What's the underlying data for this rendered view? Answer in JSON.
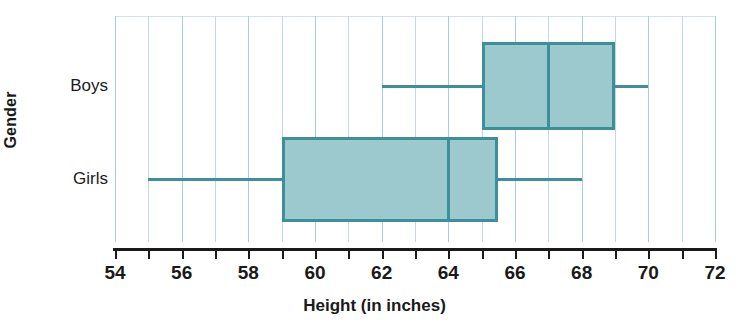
{
  "chart_data": {
    "type": "box",
    "title": "",
    "xlabel": "Height (in inches)",
    "ylabel": "Gender",
    "xlim": [
      54,
      72
    ],
    "xticks": [
      54,
      55,
      56,
      57,
      58,
      59,
      60,
      61,
      62,
      63,
      64,
      65,
      66,
      67,
      68,
      69,
      70,
      71,
      72
    ],
    "xtick_labels": [
      "54",
      "",
      "56",
      "",
      "58",
      "",
      "60",
      "",
      "62",
      "",
      "64",
      "",
      "66",
      "",
      "68",
      "",
      "70",
      "",
      "72"
    ],
    "grid": true,
    "grid_axis": "x",
    "legend": false,
    "categories": [
      "Boys",
      "Girls"
    ],
    "boxes": [
      {
        "name": "Boys",
        "min": 62,
        "q1": 65,
        "median": 67,
        "q3": 69,
        "max": 70
      },
      {
        "name": "Girls",
        "min": 55,
        "q1": 59,
        "median": 64,
        "q3": 65.5,
        "max": 68
      }
    ],
    "colors": {
      "box_fill": "#9bc9cd",
      "box_stroke": "#3f8f9b",
      "gridline": "#bfd9e6",
      "axis": "#1a1a1a"
    }
  }
}
